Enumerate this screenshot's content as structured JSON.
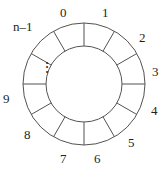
{
  "figure": {
    "kind": "circular-buffer-ring-diagram",
    "geometry": {
      "center_x": 84,
      "center_y": 84,
      "outer_radius": 61,
      "inner_radius": 38,
      "sector_count": 12,
      "sector_degrees": 30,
      "start_angle_deg": -90
    },
    "colors": {
      "stroke": "#56524f",
      "text": "#231f20",
      "background": "#ffffff"
    },
    "ellipsis": {
      "glyph": "⋮",
      "x": 40,
      "y": 62
    },
    "labels": [
      {
        "name": "slot-0",
        "text": "0",
        "x": 60,
        "y": 6
      },
      {
        "name": "slot-1",
        "text": "1",
        "x": 102,
        "y": 6
      },
      {
        "name": "slot-2",
        "text": "2",
        "x": 139,
        "y": 31
      },
      {
        "name": "slot-3",
        "text": "3",
        "x": 152,
        "y": 65
      },
      {
        "name": "slot-4",
        "text": "4",
        "x": 151,
        "y": 104
      },
      {
        "name": "slot-5",
        "text": "5",
        "x": 128,
        "y": 136
      },
      {
        "name": "slot-6",
        "text": "6",
        "x": 94,
        "y": 152
      },
      {
        "name": "slot-7",
        "text": "7",
        "x": 60,
        "y": 152
      },
      {
        "name": "slot-8",
        "text": "8",
        "x": 24,
        "y": 128
      },
      {
        "name": "slot-9",
        "text": "9",
        "x": 3,
        "y": 92
      },
      {
        "name": "slot-n-1",
        "text": "n–1",
        "x": 13,
        "y": 20
      }
    ]
  }
}
